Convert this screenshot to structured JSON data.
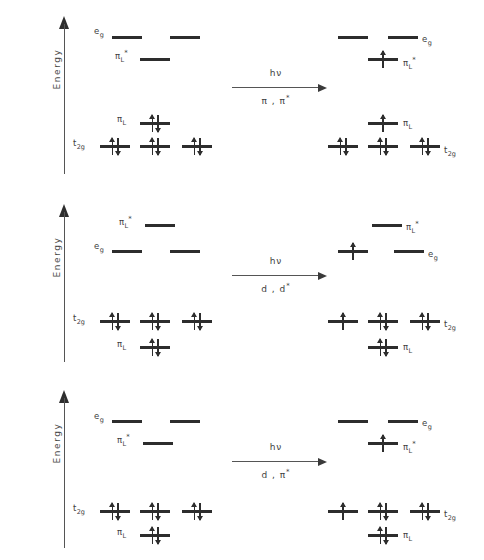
{
  "figure": {
    "axis_label": "Energy",
    "title": ""
  },
  "panels": [
    {
      "id": "panel-pi-pi-star",
      "axis_label": "Energy",
      "transition": {
        "photon_label": "hν",
        "type_label": "π , π*",
        "type_plain": "pi, pi*"
      },
      "left_state": {
        "levels": [
          {
            "name": "eg-left-1",
            "label": "",
            "x": 112,
            "y": 36,
            "w": 30,
            "electrons": []
          },
          {
            "name": "eg-left-2",
            "label": "",
            "x": 170,
            "y": 36,
            "w": 30,
            "electrons": []
          },
          {
            "name": "piL-star",
            "label": "",
            "x": 140,
            "y": 58,
            "w": 30,
            "electrons": []
          },
          {
            "name": "piL",
            "label": "",
            "x": 140,
            "y": 122,
            "w": 30,
            "electrons": [
              "up",
              "down"
            ]
          },
          {
            "name": "t2g-left-1",
            "label": "",
            "x": 100,
            "y": 145,
            "w": 30,
            "electrons": [
              "up",
              "down"
            ]
          },
          {
            "name": "t2g-left-2",
            "label": "",
            "x": 140,
            "y": 145,
            "w": 30,
            "electrons": [
              "up",
              "down"
            ]
          },
          {
            "name": "t2g-left-3",
            "label": "",
            "x": 182,
            "y": 145,
            "w": 30,
            "electrons": [
              "up",
              "down"
            ]
          }
        ],
        "labels": [
          {
            "name": "label-eg",
            "text": "e",
            "sub": "g",
            "sup": "",
            "x": 94,
            "y": 26
          },
          {
            "name": "label-piL-star",
            "text": "π",
            "sub": "L",
            "sup": "*",
            "x": 115,
            "y": 49
          },
          {
            "name": "label-piL",
            "text": "π",
            "sub": "L",
            "sup": "",
            "x": 117,
            "y": 114
          },
          {
            "name": "label-t2g",
            "text": "t",
            "sub": "2g",
            "sup": "",
            "x": 73,
            "y": 138
          }
        ]
      },
      "right_state": {
        "levels": [
          {
            "name": "eg-right-1",
            "label": "",
            "x": 338,
            "y": 36,
            "w": 30,
            "electrons": []
          },
          {
            "name": "eg-right-2",
            "label": "",
            "x": 388,
            "y": 36,
            "w": 30,
            "electrons": []
          },
          {
            "name": "piL-star-r",
            "label": "",
            "x": 368,
            "y": 58,
            "w": 30,
            "electrons": [
              "up"
            ]
          },
          {
            "name": "piL-r",
            "label": "",
            "x": 368,
            "y": 122,
            "w": 30,
            "electrons": [
              "up"
            ]
          },
          {
            "name": "t2g-right-1",
            "label": "",
            "x": 328,
            "y": 145,
            "w": 30,
            "electrons": [
              "up",
              "down"
            ]
          },
          {
            "name": "t2g-right-2",
            "label": "",
            "x": 368,
            "y": 145,
            "w": 30,
            "electrons": [
              "up",
              "down"
            ]
          },
          {
            "name": "t2g-right-3",
            "label": "",
            "x": 410,
            "y": 145,
            "w": 30,
            "electrons": [
              "up",
              "down"
            ]
          }
        ],
        "labels": [
          {
            "name": "label-eg-r",
            "text": "e",
            "sub": "g",
            "sup": "",
            "x": 422,
            "y": 34
          },
          {
            "name": "label-piL-star-r",
            "text": "π",
            "sub": "L",
            "sup": "*",
            "x": 403,
            "y": 56
          },
          {
            "name": "label-piL-r",
            "text": "π",
            "sub": "L",
            "sup": "",
            "x": 403,
            "y": 118
          },
          {
            "name": "label-t2g-r",
            "text": "t",
            "sub": "2g",
            "sup": "",
            "x": 444,
            "y": 145
          }
        ]
      }
    },
    {
      "id": "panel-d-d-star",
      "axis_label": "Energy",
      "transition": {
        "photon_label": "hν",
        "type_label": "d , d*",
        "type_plain": "d, d*"
      },
      "left_state": {
        "levels": [
          {
            "name": "piL-star",
            "label": "",
            "x": 145,
            "y": 36,
            "w": 30,
            "electrons": []
          },
          {
            "name": "eg-left-1",
            "label": "",
            "x": 112,
            "y": 62,
            "w": 30,
            "electrons": []
          },
          {
            "name": "eg-left-2",
            "label": "",
            "x": 170,
            "y": 62,
            "w": 30,
            "electrons": []
          },
          {
            "name": "t2g-left-1",
            "label": "",
            "x": 100,
            "y": 132,
            "w": 30,
            "electrons": [
              "up",
              "down"
            ]
          },
          {
            "name": "t2g-left-2",
            "label": "",
            "x": 140,
            "y": 132,
            "w": 30,
            "electrons": [
              "up",
              "down"
            ]
          },
          {
            "name": "t2g-left-3",
            "label": "",
            "x": 182,
            "y": 132,
            "w": 30,
            "electrons": [
              "up",
              "down"
            ]
          },
          {
            "name": "piL",
            "label": "",
            "x": 140,
            "y": 158,
            "w": 30,
            "electrons": [
              "up",
              "down"
            ]
          }
        ],
        "labels": [
          {
            "name": "label-piL-star",
            "text": "π",
            "sub": "L",
            "sup": "*",
            "x": 119,
            "y": 27
          },
          {
            "name": "label-eg",
            "text": "e",
            "sub": "g",
            "sup": "",
            "x": 94,
            "y": 53
          },
          {
            "name": "label-t2g",
            "text": "t",
            "sub": "2g",
            "sup": "",
            "x": 73,
            "y": 125
          },
          {
            "name": "label-piL",
            "text": "π",
            "sub": "L",
            "sup": "",
            "x": 117,
            "y": 151
          }
        ]
      },
      "right_state": {
        "levels": [
          {
            "name": "piL-star-r",
            "label": "",
            "x": 372,
            "y": 36,
            "w": 30,
            "electrons": []
          },
          {
            "name": "eg-right-1",
            "label": "",
            "x": 338,
            "y": 62,
            "w": 30,
            "electrons": [
              "up"
            ]
          },
          {
            "name": "eg-right-2",
            "label": "",
            "x": 394,
            "y": 62,
            "w": 30,
            "electrons": []
          },
          {
            "name": "t2g-right-1",
            "label": "",
            "x": 328,
            "y": 132,
            "w": 30,
            "electrons": [
              "up"
            ]
          },
          {
            "name": "t2g-right-2",
            "label": "",
            "x": 368,
            "y": 132,
            "w": 30,
            "electrons": [
              "up",
              "down"
            ]
          },
          {
            "name": "t2g-right-3",
            "label": "",
            "x": 410,
            "y": 132,
            "w": 30,
            "electrons": [
              "up",
              "down"
            ]
          },
          {
            "name": "piL-r",
            "label": "",
            "x": 368,
            "y": 158,
            "w": 30,
            "electrons": [
              "up",
              "down"
            ]
          }
        ],
        "labels": [
          {
            "name": "label-piL-star-r",
            "text": "π",
            "sub": "L",
            "sup": "*",
            "x": 406,
            "y": 32
          },
          {
            "name": "label-eg-r",
            "text": "e",
            "sub": "g",
            "sup": "",
            "x": 428,
            "y": 61
          },
          {
            "name": "label-t2g-r",
            "text": "t",
            "sub": "2g",
            "sup": "",
            "x": 444,
            "y": 131
          },
          {
            "name": "label-piL-r",
            "text": "π",
            "sub": "L",
            "sup": "",
            "x": 403,
            "y": 154
          }
        ]
      }
    },
    {
      "id": "panel-d-pi-star",
      "axis_label": "Energy",
      "transition": {
        "photon_label": "hν",
        "type_label": "d , π*",
        "type_plain": "d, pi*"
      },
      "left_state": {
        "levels": [
          {
            "name": "eg-left-1",
            "label": "",
            "x": 112,
            "y": 46,
            "w": 30,
            "electrons": []
          },
          {
            "name": "eg-left-2",
            "label": "",
            "x": 170,
            "y": 46,
            "w": 30,
            "electrons": []
          },
          {
            "name": "piL-star",
            "label": "",
            "x": 143,
            "y": 68,
            "w": 30,
            "electrons": []
          },
          {
            "name": "t2g-left-1",
            "label": "",
            "x": 100,
            "y": 136,
            "w": 30,
            "electrons": [
              "up",
              "down"
            ]
          },
          {
            "name": "t2g-left-2",
            "label": "",
            "x": 140,
            "y": 136,
            "w": 30,
            "electrons": [
              "up",
              "down"
            ]
          },
          {
            "name": "t2g-left-3",
            "label": "",
            "x": 182,
            "y": 136,
            "w": 30,
            "electrons": [
              "up",
              "down"
            ]
          },
          {
            "name": "piL",
            "label": "",
            "x": 140,
            "y": 160,
            "w": 30,
            "electrons": [
              "up",
              "down"
            ]
          }
        ],
        "labels": [
          {
            "name": "label-eg",
            "text": "e",
            "sub": "g",
            "sup": "",
            "x": 94,
            "y": 37
          },
          {
            "name": "label-piL-star",
            "text": "π",
            "sub": "L",
            "sup": "*",
            "x": 117,
            "y": 59
          },
          {
            "name": "label-t2g",
            "text": "t",
            "sub": "2g",
            "sup": "",
            "x": 73,
            "y": 129
          },
          {
            "name": "label-piL",
            "text": "π",
            "sub": "L",
            "sup": "",
            "x": 117,
            "y": 153
          }
        ]
      },
      "right_state": {
        "levels": [
          {
            "name": "eg-right-1",
            "label": "",
            "x": 338,
            "y": 46,
            "w": 30,
            "electrons": []
          },
          {
            "name": "eg-right-2",
            "label": "",
            "x": 388,
            "y": 46,
            "w": 30,
            "electrons": []
          },
          {
            "name": "piL-star-r",
            "label": "",
            "x": 368,
            "y": 68,
            "w": 30,
            "electrons": [
              "up"
            ]
          },
          {
            "name": "t2g-right-1",
            "label": "",
            "x": 328,
            "y": 136,
            "w": 30,
            "electrons": [
              "up"
            ]
          },
          {
            "name": "t2g-right-2",
            "label": "",
            "x": 368,
            "y": 136,
            "w": 30,
            "electrons": [
              "up",
              "down"
            ]
          },
          {
            "name": "t2g-right-3",
            "label": "",
            "x": 410,
            "y": 136,
            "w": 30,
            "electrons": [
              "up",
              "down"
            ]
          },
          {
            "name": "piL-r",
            "label": "",
            "x": 368,
            "y": 160,
            "w": 30,
            "electrons": [
              "up",
              "down"
            ]
          }
        ],
        "labels": [
          {
            "name": "label-eg-r",
            "text": "e",
            "sub": "g",
            "sup": "",
            "x": 422,
            "y": 44
          },
          {
            "name": "label-piL-star-r",
            "text": "π",
            "sub": "L",
            "sup": "*",
            "x": 403,
            "y": 66
          },
          {
            "name": "label-t2g-r",
            "text": "t",
            "sub": "2g",
            "sup": "",
            "x": 444,
            "y": 135
          },
          {
            "name": "label-piL-r",
            "text": "π",
            "sub": "L",
            "sup": "",
            "x": 403,
            "y": 156
          }
        ]
      }
    }
  ],
  "transition_positions": {
    "x": 232,
    "y": 68
  },
  "colors": {
    "level": "#2d2d2d",
    "text": "#3d3d3d",
    "axis": "#555555",
    "background": "#ffffff"
  }
}
